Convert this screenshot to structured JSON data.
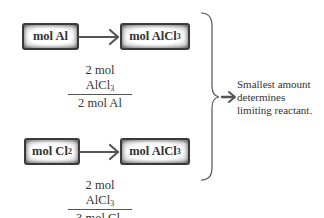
{
  "rows": [
    {
      "from_box": {
        "label": "mol Al",
        "sub": ""
      },
      "to_box": {
        "label": "mol AlCl",
        "sub": "3"
      },
      "conversion": {
        "numerator": {
          "text": "2 mol AlCl",
          "sub": "3"
        },
        "denominator": {
          "text": "2 mol Al",
          "sub": ""
        }
      }
    },
    {
      "from_box": {
        "label": "mol Cl",
        "sub": "2"
      },
      "to_box": {
        "label": "mol AlCl",
        "sub": "3"
      },
      "conversion": {
        "numerator": {
          "text": "2 mol AlCl",
          "sub": "3"
        },
        "denominator": {
          "text": "3 mol Cl",
          "sub": "2"
        }
      }
    }
  ],
  "conclusion": {
    "lines": [
      "Smallest amount",
      "determines",
      "limiting reactant."
    ]
  },
  "icons": {
    "row_arrow": "right-arrow-icon",
    "brace": "right-curly-brace",
    "conclusion_arrow": "right-arrow-icon"
  },
  "colors": {
    "stroke": "#555555",
    "box_border": "#3a3a3a",
    "text": "#333333"
  }
}
